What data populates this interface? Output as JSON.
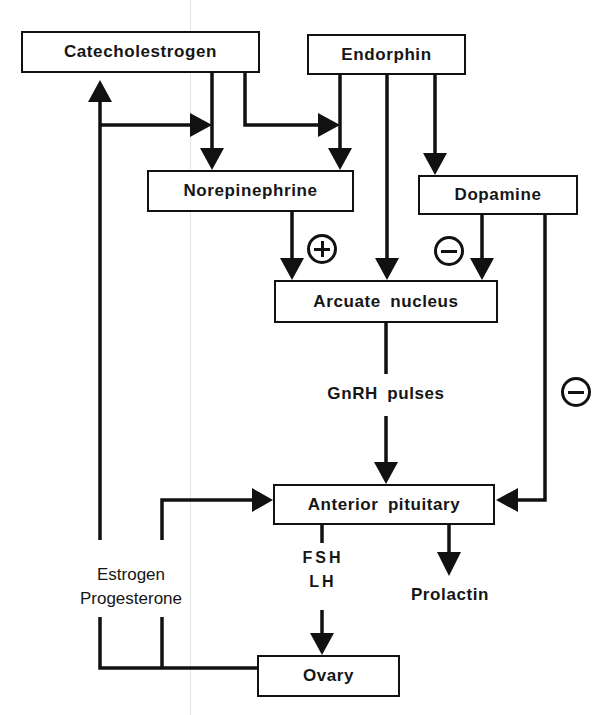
{
  "diagram": {
    "nodes": {
      "catecholestrogen": "Catecholestrogen",
      "endorphin": "Endorphin",
      "norepinephrine": "Norepinephrine",
      "dopamine": "Dopamine",
      "arcuate_nucleus": "Arcuate nucleus",
      "anterior_pituitary": "Anterior pituitary",
      "ovary": "Ovary"
    },
    "labels": {
      "gnrh": "GnRH pulses",
      "fsh": "FSH",
      "lh": "LH",
      "prolactin": "Prolactin",
      "estrogen": "Estrogen",
      "progesterone": "Progesterone"
    },
    "signs": {
      "norepinephrine_to_arcuate": "+",
      "dopamine_to_arcuate": "−",
      "dopamine_to_pituitary": "−"
    },
    "edges": [
      {
        "from": "Catecholestrogen",
        "to": "Norepinephrine"
      },
      {
        "from": "Catecholestrogen",
        "to": "Norepinephrine (via Endorphin branch)"
      },
      {
        "from": "Endorphin",
        "to": "Norepinephrine"
      },
      {
        "from": "Endorphin",
        "to": "Arcuate nucleus"
      },
      {
        "from": "Endorphin",
        "to": "Dopamine"
      },
      {
        "from": "Norepinephrine",
        "to": "Arcuate nucleus",
        "sign": "+"
      },
      {
        "from": "Dopamine",
        "to": "Arcuate nucleus",
        "sign": "−"
      },
      {
        "from": "Dopamine",
        "to": "Anterior pituitary",
        "sign": "−"
      },
      {
        "from": "Arcuate nucleus",
        "to": "Anterior pituitary",
        "label": "GnRH pulses"
      },
      {
        "from": "Anterior pituitary",
        "to": "Ovary",
        "label": "FSH LH"
      },
      {
        "from": "Anterior pituitary",
        "to": "Prolactin"
      },
      {
        "from": "Ovary",
        "to": "Anterior pituitary",
        "label": "Estrogen Progesterone"
      },
      {
        "from": "Ovary",
        "to": "Catecholestrogen",
        "label": "Estrogen Progesterone"
      }
    ],
    "colors": {
      "ink": "#111111",
      "background": "#ffffff"
    }
  }
}
